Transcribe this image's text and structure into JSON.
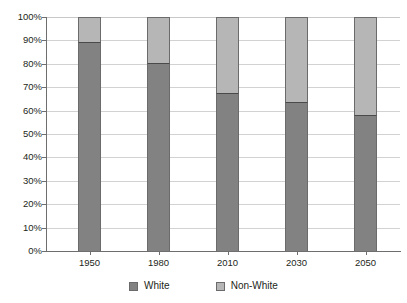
{
  "chart_data": {
    "type": "bar",
    "stacked": true,
    "stack_mode": "percent",
    "title": "",
    "subtitle": "",
    "xlabel": "",
    "ylabel": "",
    "categories": [
      "1950",
      "1980",
      "2010",
      "2030",
      "2050"
    ],
    "series": [
      {
        "name": "White",
        "color": "#828282",
        "values": [
          89.5,
          80.5,
          67.5,
          63.5,
          58
        ]
      },
      {
        "name": "Non-White",
        "color": "#b6b6b6",
        "values": [
          10.5,
          19.5,
          32.5,
          36.5,
          42
        ]
      }
    ],
    "ylim": [
      0,
      100
    ],
    "ytick_values": [
      0,
      10,
      20,
      30,
      40,
      50,
      60,
      70,
      80,
      90,
      100
    ],
    "ytick_labels": [
      "0%",
      "10%",
      "20%",
      "30%",
      "40%",
      "50%",
      "60%",
      "70%",
      "80%",
      "90%",
      "100%"
    ],
    "grid": true,
    "grid_axis": "y",
    "legend_position": "bottom",
    "annotations": []
  },
  "axes": {
    "y_labels": [
      "100%",
      "90%",
      "80%",
      "70%",
      "60%",
      "50%",
      "40%",
      "30%",
      "20%",
      "10%",
      "0%"
    ],
    "x_labels": [
      "1950",
      "1980",
      "2010",
      "2030",
      "2050"
    ]
  },
  "legend": {
    "items": [
      {
        "label": "White",
        "color": "#828282"
      },
      {
        "label": "Non-White",
        "color": "#b6b6b6"
      }
    ]
  },
  "colors": {
    "series_white": "#828282",
    "series_nonwhite": "#b6b6b6",
    "gridline": "#d2d2d2",
    "axis": "#6e6e6e",
    "text": "#231f20",
    "background": "#ffffff"
  }
}
